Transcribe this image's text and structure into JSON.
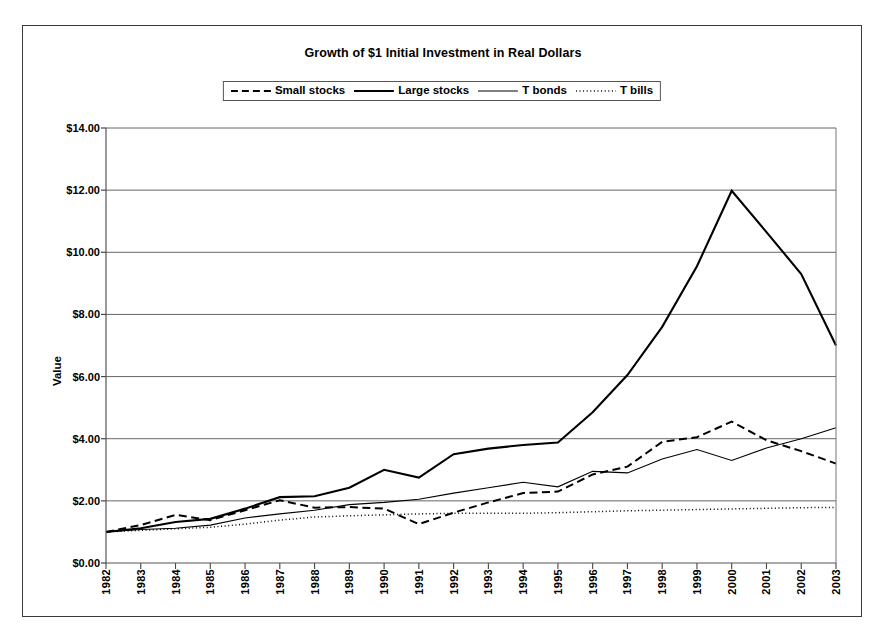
{
  "chart_data": {
    "type": "line",
    "title": "Growth of $1 Initial Investment in Real Dollars",
    "xlabel": "",
    "ylabel": "Value",
    "ylim": [
      0,
      14
    ],
    "ytick_labels": [
      "$14.00",
      "$12.00",
      "$10.00",
      "$8.00",
      "$6.00",
      "$4.00",
      "$2.00",
      "$0.00"
    ],
    "ytick_values": [
      14,
      12,
      10,
      8,
      6,
      4,
      2,
      0
    ],
    "grid": true,
    "legend_position": "top-center",
    "categories": [
      "1982",
      "1983",
      "1984",
      "1985",
      "1986",
      "1987",
      "1988",
      "1989",
      "1990",
      "1991",
      "1992",
      "1993",
      "1994",
      "1995",
      "1996",
      "1997",
      "1998",
      "1999",
      "2000",
      "2001",
      "2002",
      "2003"
    ],
    "series": [
      {
        "name": "Small stocks",
        "style": "dashed",
        "values": [
          1.0,
          1.22,
          1.55,
          1.38,
          1.7,
          2.02,
          1.78,
          1.8,
          1.75,
          1.25,
          1.62,
          1.95,
          2.25,
          2.3,
          2.85,
          3.1,
          3.9,
          4.05,
          4.55,
          3.95,
          3.6,
          3.2
        ]
      },
      {
        "name": "Large stocks",
        "style": "solid-thick",
        "values": [
          1.0,
          1.12,
          1.32,
          1.42,
          1.75,
          2.12,
          2.15,
          2.42,
          3.0,
          2.75,
          3.5,
          3.68,
          3.8,
          3.88,
          4.85,
          6.05,
          7.6,
          9.55,
          11.98,
          10.65,
          9.3,
          7.0
        ]
      },
      {
        "name": "T bonds",
        "style": "solid-thin",
        "values": [
          1.0,
          1.08,
          1.12,
          1.22,
          1.45,
          1.58,
          1.7,
          1.88,
          1.95,
          2.05,
          2.25,
          2.42,
          2.6,
          2.45,
          2.95,
          2.9,
          3.35,
          3.65,
          3.3,
          3.7,
          4.0,
          4.35
        ]
      },
      {
        "name": "T bills",
        "style": "dotted",
        "values": [
          1.0,
          1.05,
          1.1,
          1.15,
          1.25,
          1.38,
          1.48,
          1.52,
          1.55,
          1.58,
          1.6,
          1.6,
          1.6,
          1.62,
          1.65,
          1.68,
          1.7,
          1.72,
          1.74,
          1.76,
          1.78,
          1.79
        ]
      }
    ]
  }
}
